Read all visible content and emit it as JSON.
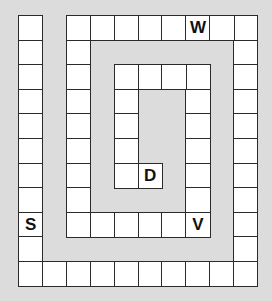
{
  "puzzle": {
    "title": "Spiral letter path board",
    "grid": {
      "cols": 10,
      "rows": 11
    },
    "colors": {
      "background": "#dcdcdc",
      "cell": "#ffffff",
      "border": "#2a2a2a"
    },
    "paths": [
      {
        "name": "outer-left-column",
        "cells": [
          [
            0,
            0
          ],
          [
            0,
            1
          ],
          [
            0,
            2
          ],
          [
            0,
            3
          ],
          [
            0,
            4
          ],
          [
            0,
            5
          ],
          [
            0,
            6
          ],
          [
            0,
            7
          ],
          [
            0,
            8
          ],
          [
            0,
            9
          ],
          [
            0,
            10
          ]
        ]
      },
      {
        "name": "bottom-row",
        "cells": [
          [
            1,
            10
          ],
          [
            2,
            10
          ],
          [
            3,
            10
          ],
          [
            4,
            10
          ],
          [
            5,
            10
          ],
          [
            6,
            10
          ],
          [
            7,
            10
          ],
          [
            8,
            10
          ],
          [
            9,
            10
          ]
        ]
      },
      {
        "name": "right-column",
        "cells": [
          [
            9,
            0
          ],
          [
            9,
            1
          ],
          [
            9,
            2
          ],
          [
            9,
            3
          ],
          [
            9,
            4
          ],
          [
            9,
            5
          ],
          [
            9,
            6
          ],
          [
            9,
            7
          ],
          [
            9,
            8
          ],
          [
            9,
            9
          ]
        ]
      },
      {
        "name": "top-row",
        "cells": [
          [
            2,
            0
          ],
          [
            3,
            0
          ],
          [
            4,
            0
          ],
          [
            5,
            0
          ],
          [
            6,
            0
          ],
          [
            7,
            0
          ],
          [
            8,
            0
          ]
        ]
      },
      {
        "name": "second-left-column",
        "cells": [
          [
            2,
            1
          ],
          [
            2,
            2
          ],
          [
            2,
            3
          ],
          [
            2,
            4
          ],
          [
            2,
            5
          ],
          [
            2,
            6
          ],
          [
            2,
            7
          ],
          [
            2,
            8
          ]
        ]
      },
      {
        "name": "inner-bottom-row",
        "cells": [
          [
            3,
            8
          ],
          [
            4,
            8
          ],
          [
            5,
            8
          ],
          [
            6,
            8
          ],
          [
            7,
            8
          ]
        ]
      },
      {
        "name": "inner-right-column",
        "cells": [
          [
            7,
            2
          ],
          [
            7,
            3
          ],
          [
            7,
            4
          ],
          [
            7,
            5
          ],
          [
            7,
            6
          ],
          [
            7,
            7
          ]
        ]
      },
      {
        "name": "inner-top-row",
        "cells": [
          [
            4,
            2
          ],
          [
            5,
            2
          ],
          [
            6,
            2
          ]
        ]
      },
      {
        "name": "inner-left-column",
        "cells": [
          [
            4,
            3
          ],
          [
            4,
            4
          ],
          [
            4,
            5
          ],
          [
            4,
            6
          ]
        ]
      },
      {
        "name": "center-end",
        "cells": [
          [
            5,
            6
          ]
        ]
      }
    ],
    "letters": [
      {
        "label": "W",
        "col": 7,
        "row": 0
      },
      {
        "label": "S",
        "col": 0,
        "row": 8
      },
      {
        "label": "V",
        "col": 7,
        "row": 8
      },
      {
        "label": "D",
        "col": 5,
        "row": 6
      }
    ]
  }
}
